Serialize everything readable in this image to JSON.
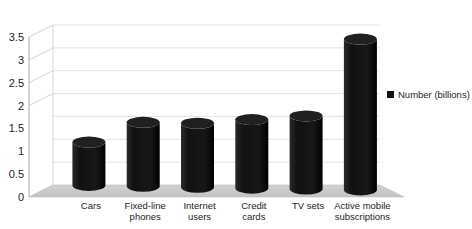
{
  "chart_data": {
    "type": "bar",
    "title": "",
    "subtitle": "",
    "xlabel": "",
    "ylabel": "",
    "categories": [
      "Cars",
      "Fixed-line phones",
      "Internet users",
      "Credit cards",
      "TV sets",
      "Active mobile subscriptions"
    ],
    "category_lines": [
      [
        "Cars"
      ],
      [
        "Fixed-line",
        "phones"
      ],
      [
        "Internet",
        "users"
      ],
      [
        "Credit",
        "cards"
      ],
      [
        "TV sets"
      ],
      [
        "Active mobile",
        "subscriptions"
      ]
    ],
    "series": [
      {
        "name": "Number (billions)",
        "values": [
          0.95,
          1.4,
          1.4,
          1.5,
          1.6,
          3.3
        ]
      }
    ],
    "values": [
      0.95,
      1.4,
      1.4,
      1.5,
      1.6,
      3.3
    ],
    "ylim": [
      0,
      3.5
    ],
    "ytick_labels": [
      "0",
      "0.5",
      "1",
      "1.5",
      "2",
      "2.5",
      "3",
      "3.5"
    ],
    "ytick_values": [
      0,
      0.5,
      1,
      1.5,
      2,
      2.5,
      3,
      3.5
    ],
    "grid": true,
    "legend": {
      "position": "right",
      "entries": [
        {
          "label": "Number (billions)",
          "marker": "square",
          "color": "#111111"
        }
      ]
    },
    "style": {
      "bar_color": "#1a1a1a",
      "bar_shape": "cylinder",
      "floor_color": "#c9c9c9",
      "gridline_color": "#d6d6d6",
      "axis_color": "#9a9a9a",
      "background": "#ffffff",
      "three_d": true
    }
  }
}
